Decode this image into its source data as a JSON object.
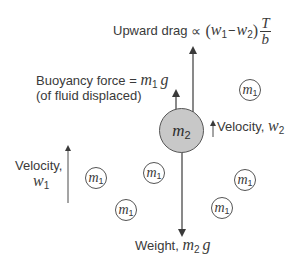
{
  "diagram": {
    "drag": {
      "label": "Upward drag",
      "prop_symbol": "∝",
      "expr_open": "(",
      "w1": "w",
      "w1_sub": "1",
      "minus": "−",
      "w2": "w",
      "w2_sub": "2",
      "expr_close": ")",
      "frac_num": "T",
      "frac_den": "b"
    },
    "buoyancy": {
      "line1_label": "Buoyancy force = ",
      "mass": "m",
      "mass_sub": "1",
      "g": "g",
      "line2": "(of fluid displaced)"
    },
    "large_particle": {
      "symbol": "m",
      "sub": "2",
      "fill": "#c8c8c8"
    },
    "velocity_w2": {
      "label": "Velocity, ",
      "symbol": "w",
      "sub": "2"
    },
    "velocity_w1": {
      "label": "Velocity,",
      "symbol": "w",
      "sub": "1"
    },
    "weight": {
      "label": "Weight, ",
      "mass": "m",
      "mass_sub": "2",
      "g": "g"
    },
    "small_particles": [
      {
        "symbol": "m",
        "sub": "1"
      },
      {
        "symbol": "m",
        "sub": "1"
      },
      {
        "symbol": "m",
        "sub": "1"
      },
      {
        "symbol": "m",
        "sub": "1"
      },
      {
        "symbol": "m",
        "sub": "1"
      },
      {
        "symbol": "m",
        "sub": "1"
      }
    ],
    "colors": {
      "line": "#4a4a4a",
      "text": "#3a3a3a",
      "large_fill": "#c8c8c8"
    }
  }
}
